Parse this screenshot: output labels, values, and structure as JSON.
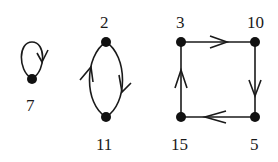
{
  "diagram": {
    "type": "directed-graph-cycles",
    "nodes": [
      {
        "id": "7",
        "label": "7"
      },
      {
        "id": "2",
        "label": "2"
      },
      {
        "id": "11",
        "label": "11"
      },
      {
        "id": "3",
        "label": "3"
      },
      {
        "id": "10",
        "label": "10"
      },
      {
        "id": "5",
        "label": "5"
      },
      {
        "id": "15",
        "label": "15"
      }
    ],
    "edges": [
      {
        "from": "7",
        "to": "7",
        "kind": "self-loop"
      },
      {
        "from": "2",
        "to": "11"
      },
      {
        "from": "11",
        "to": "2"
      },
      {
        "from": "3",
        "to": "10"
      },
      {
        "from": "10",
        "to": "5"
      },
      {
        "from": "5",
        "to": "15"
      },
      {
        "from": "15",
        "to": "3"
      }
    ],
    "cycles": [
      [
        "7"
      ],
      [
        "2",
        "11"
      ],
      [
        "3",
        "10",
        "5",
        "15"
      ]
    ]
  }
}
